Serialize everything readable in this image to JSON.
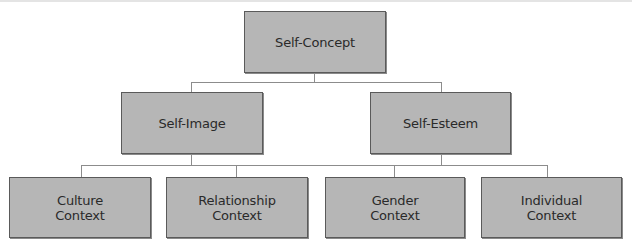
{
  "diagram": {
    "type": "hierarchy-tree",
    "root": {
      "label": "Self-Concept"
    },
    "level2": [
      {
        "label": "Self-Image"
      },
      {
        "label": "Self-Esteem"
      }
    ],
    "level3": [
      {
        "line1": "Culture",
        "line2": "Context"
      },
      {
        "line1": "Relationship",
        "line2": "Context"
      },
      {
        "line1": "Gender",
        "line2": "Context"
      },
      {
        "line1": "Individual",
        "line2": "Context"
      }
    ],
    "colors": {
      "box_fill": "#b6b6b6",
      "box_border": "#5a5a5a",
      "connector": "#8c8c8c",
      "text": "#2a2a2a"
    }
  }
}
